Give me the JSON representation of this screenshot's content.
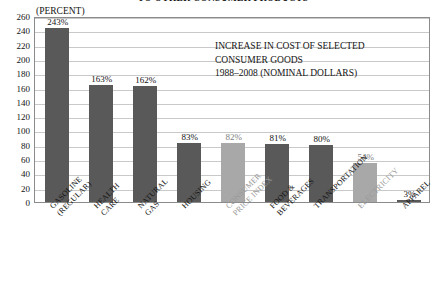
{
  "title_clipped": "TO OTHER CONSUMER PRODUCTS",
  "unit_caption": "(PERCENT)",
  "annotation": {
    "line1": "INCREASE IN COST OF SELECTED",
    "line2": "CONSUMER GOODS",
    "line3": "1988–2008 (NOMINAL DOLLARS)"
  },
  "colors": {
    "bar_dark": "#595959",
    "bar_light": "#a8a8a8",
    "gridline": "#c9c9c9",
    "frame": "#8b8b8b",
    "text": "#141414",
    "text_light": "#9a9a9a"
  },
  "chart_data": {
    "type": "bar",
    "title": "TO OTHER CONSUMER PRODUCTS",
    "subtitle": "INCREASE IN COST OF SELECTED CONSUMER GOODS 1988–2008 (NOMINAL DOLLARS)",
    "xlabel": "",
    "ylabel": "(PERCENT)",
    "ylim": [
      0,
      260
    ],
    "ytick_step": 20,
    "yticks": [
      0,
      20,
      40,
      60,
      80,
      100,
      120,
      140,
      160,
      180,
      200,
      220,
      240,
      260
    ],
    "ytick_labels": [
      "0",
      "20",
      "40",
      "60",
      "80",
      "100",
      "120",
      "140",
      "160",
      "180",
      "200",
      "220",
      "240",
      "260"
    ],
    "grid": true,
    "legend": false,
    "categories": [
      "GASOLINE (REGULAR)",
      "HEALTH CARE",
      "NATURAL GAS",
      "HOUSING",
      "CONSUMER PRICE INDEX",
      "FOOD & BEVERAGES",
      "TRANSPORTATION",
      "ELECTRICITY",
      "APPAREL"
    ],
    "values": [
      243,
      163,
      162,
      83,
      82,
      81,
      80,
      54,
      3
    ],
    "value_labels": [
      "243%",
      "163%",
      "162%",
      "83%",
      "82%",
      "81%",
      "80%",
      "54%",
      "3%"
    ],
    "bars": [
      {
        "label_line1": "GASOLINE",
        "label_line2": "(REGULAR)",
        "value": 243,
        "value_label": "243%",
        "shade": "dark"
      },
      {
        "label_line1": "HEALTH",
        "label_line2": "CARE",
        "value": 163,
        "value_label": "163%",
        "shade": "dark"
      },
      {
        "label_line1": "NATURAL",
        "label_line2": "GAS",
        "value": 162,
        "value_label": "162%",
        "shade": "dark"
      },
      {
        "label_line1": "HOUSING",
        "label_line2": "",
        "value": 83,
        "value_label": "83%",
        "shade": "dark"
      },
      {
        "label_line1": "CONSUMER",
        "label_line2": "PRICE INDEX",
        "value": 82,
        "value_label": "82%",
        "shade": "light"
      },
      {
        "label_line1": "FOOD &",
        "label_line2": "BEVERAGES",
        "value": 81,
        "value_label": "81%",
        "shade": "dark"
      },
      {
        "label_line1": "TRANSPORTATION",
        "label_line2": "",
        "value": 80,
        "value_label": "80%",
        "shade": "dark"
      },
      {
        "label_line1": "ELECTRICITY",
        "label_line2": "",
        "value": 54,
        "value_label": "54%",
        "shade": "light"
      },
      {
        "label_line1": "APPAREL",
        "label_line2": "",
        "value": 3,
        "value_label": "3%",
        "shade": "dark"
      }
    ]
  }
}
